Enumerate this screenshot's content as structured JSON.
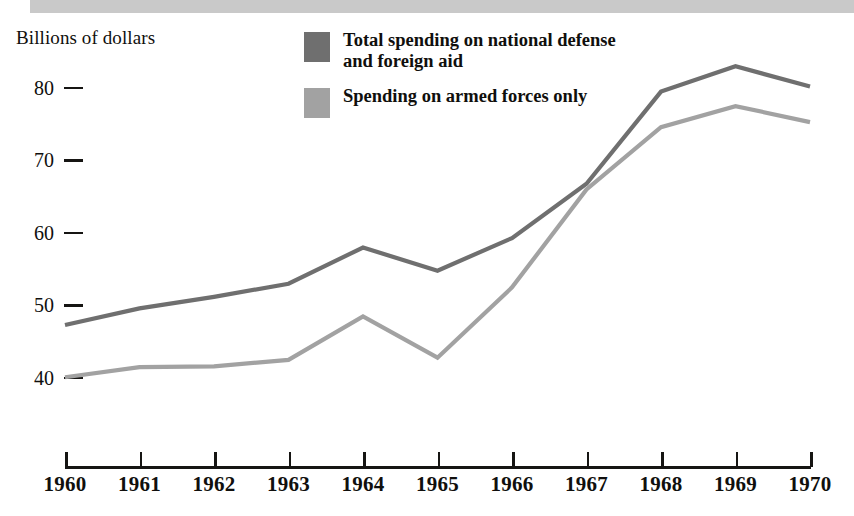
{
  "banner": {
    "label": "scan-banner-bar",
    "color": "#c9c9c9"
  },
  "axis_title": "Billions of dollars",
  "legend": {
    "items": [
      {
        "label": "Total spending on national defense and foreign aid",
        "color": "#6f6f6f",
        "swatch_name": "legend-swatch-total-spending"
      },
      {
        "label": "Spending on armed forces only",
        "color": "#a2a2a2",
        "swatch_name": "legend-swatch-armed-forces"
      }
    ]
  },
  "y_ticks": [
    {
      "label": "80",
      "value": 80
    },
    {
      "label": "70",
      "value": 70
    },
    {
      "label": "60",
      "value": 60
    },
    {
      "label": "50",
      "value": 50
    },
    {
      "label": "40",
      "value": 40
    }
  ],
  "x_ticks": [
    "1960",
    "1961",
    "1962",
    "1963",
    "1964",
    "1965",
    "1966",
    "1967",
    "1968",
    "1969",
    "1970"
  ],
  "chart_data": {
    "type": "line",
    "title": "",
    "xlabel": "",
    "ylabel": "Billions of dollars",
    "categories": [
      "1960",
      "1961",
      "1962",
      "1963",
      "1964",
      "1965",
      "1966",
      "1967",
      "1968",
      "1969",
      "1970"
    ],
    "x": [
      1960,
      1961,
      1962,
      1963,
      1964,
      1965,
      1966,
      1967,
      1968,
      1969,
      1970
    ],
    "ylim": [
      36,
      86
    ],
    "xlim": [
      1960,
      1970
    ],
    "yticks": [
      40,
      50,
      60,
      70,
      80
    ],
    "grid": false,
    "legend_position": "top-center",
    "series": [
      {
        "name": "Total spending on national defense and foreign aid",
        "color": "#6f6f6f",
        "values": [
          47.3,
          49.6,
          51.2,
          53.0,
          58.0,
          54.8,
          59.3,
          66.8,
          79.5,
          83.0,
          80.2
        ]
      },
      {
        "name": "Spending on armed forces only",
        "color": "#a2a2a2",
        "values": [
          40.1,
          41.5,
          41.6,
          42.5,
          48.5,
          42.8,
          52.5,
          66.0,
          74.6,
          77.5,
          75.3
        ]
      }
    ]
  }
}
